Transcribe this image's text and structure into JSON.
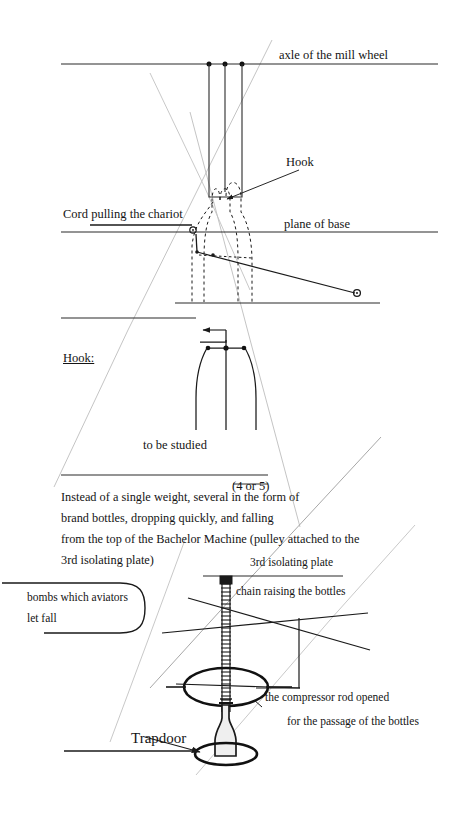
{
  "document": {
    "title": "Instead of a single weight, several in the form of brand bottles",
    "kind": "hand-drawn technical sketch with handwritten annotations",
    "page_background": "#ffffff",
    "ink_color": "#1a1a1a",
    "faint_line_color": "#b9b9b9"
  },
  "annotations": {
    "axle_of_mill_wheel": "axle of the mill wheel",
    "hook_callout": "Hook",
    "cord_pulling_chariot": "Cord pulling the chariot",
    "plane_of_base": "plane of base",
    "hook_detail_title": "Hook:",
    "to_be_studied": "to be studied",
    "section_number": "(4 or 5)",
    "third_isolating_plate": "3rd isolating plate",
    "chain_raising_the_bottles": "chain raising the bottles",
    "bombs_line_1": "bombs which aviators",
    "bombs_line_2": "let fall",
    "compressor_line_1": "the compressor rod opened",
    "compressor_line_2": "for the passage of the bottles",
    "trapdoor": "Trapdoor"
  },
  "body_text": {
    "lines": [
      "Instead of a single weight, several in the form of",
      "brand bottles, dropping quickly, and falling",
      "from the top of the Bachelor Machine (pulley attached to the",
      "3rd isolating plate)"
    ]
  },
  "figure_parts": {
    "mill_wheel_axle_line": "horizontal rule across upper sheet",
    "axle_pivot_dots": 3,
    "chariot_rectangle": "tall open rectangle hanging from axle",
    "dotted_bottles": 3,
    "plane_of_base_line": "horizontal rule through middle",
    "cord_line": "short horizontal line ending in small ring",
    "sloping_cord": "line descending right to a small ring",
    "hook_detail_flask": "flask outline with arrow and three nodes",
    "chain_ladder": "vertical ladder of rungs = chain",
    "compressor_ellipse": "large bold ellipse",
    "trapdoor_ellipse": "small bold ellipse",
    "falling_bottle": "bottle silhouette between ellipses",
    "perspective_cone": "two faint grey diverging guide lines",
    "stray_diagonals": "several faint grey pencil diagonals"
  }
}
